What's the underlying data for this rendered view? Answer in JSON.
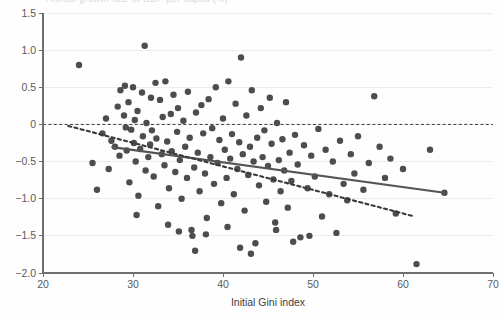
{
  "figure": {
    "background": "#fefefe",
    "point_color": "#4d4d4d",
    "solid_fit_color": "#555555",
    "dotted_fit_color": "#3a3a3a",
    "gridline_color": "#ededed",
    "axis_color": "#6f6f6f",
    "cropped_top_text": "Annual growth rate of GDP per capita (%)"
  },
  "chart_data": {
    "type": "scatter",
    "title": "",
    "xlabel": "Initial Gini index",
    "ylabel": "",
    "xlim": [
      20,
      70
    ],
    "ylim": [
      -2.0,
      1.5
    ],
    "xticks": [
      20,
      30,
      40,
      50,
      60,
      70
    ],
    "xtick_labels": [
      "20",
      "30",
      "40",
      "50",
      "60",
      "70"
    ],
    "yticks": [
      1.5,
      1.0,
      0.5,
      0,
      -0.5,
      -1.0,
      -1.5,
      -2.0
    ],
    "ytick_labels": [
      "1.5",
      "1.0",
      "0.5",
      "0",
      "−0.5",
      "−1.0",
      "−1.5",
      "−2.0"
    ],
    "grid": true,
    "legend": "none",
    "marker": "filled-circle",
    "marker_size_px": 6.4,
    "reference_lines": [
      {
        "name": "zero-reference-line",
        "style": "dashed",
        "y": 0,
        "x_from": 20,
        "x_to": 70
      }
    ],
    "fit_lines": [
      {
        "name": "solid-regression-line",
        "style": "solid",
        "x_from": 27.7,
        "y_from": -0.305,
        "x_to": 64.6,
        "y_to": -0.92
      },
      {
        "name": "dotted-regression-line",
        "style": "dotted",
        "x_from": 22.8,
        "y_from": -0.02,
        "x_to": 61.0,
        "y_to": -1.23
      }
    ],
    "points": [
      [
        24.0,
        0.8
      ],
      [
        26.6,
        -0.12
      ],
      [
        27.3,
        -0.6
      ],
      [
        27.6,
        -0.22
      ],
      [
        28.0,
        -0.3
      ],
      [
        28.3,
        0.24
      ],
      [
        28.5,
        -0.42
      ],
      [
        28.6,
        0.46
      ],
      [
        29.0,
        0.12
      ],
      [
        29.1,
        0.52
      ],
      [
        29.2,
        -0.04
      ],
      [
        29.3,
        -0.35
      ],
      [
        29.5,
        0.3
      ],
      [
        29.6,
        -0.78
      ],
      [
        29.8,
        -0.07
      ],
      [
        30.0,
        0.5
      ],
      [
        30.1,
        -0.25
      ],
      [
        30.2,
        0.06
      ],
      [
        30.3,
        -0.5
      ],
      [
        30.5,
        0.18
      ],
      [
        30.6,
        -0.96
      ],
      [
        30.8,
        -0.33
      ],
      [
        31.0,
        0.43
      ],
      [
        31.1,
        -0.16
      ],
      [
        31.3,
        1.06
      ],
      [
        31.4,
        -0.62
      ],
      [
        31.5,
        0.02
      ],
      [
        31.7,
        -0.44
      ],
      [
        31.9,
        -0.27
      ],
      [
        32.0,
        0.36
      ],
      [
        32.1,
        -0.08
      ],
      [
        32.3,
        -0.7
      ],
      [
        32.5,
        0.56
      ],
      [
        32.6,
        -0.19
      ],
      [
        32.8,
        -1.1
      ],
      [
        33.0,
        0.33
      ],
      [
        33.2,
        -0.4
      ],
      [
        33.3,
        0.1
      ],
      [
        33.5,
        -0.55
      ],
      [
        33.6,
        0.58
      ],
      [
        33.8,
        -0.23
      ],
      [
        34.0,
        -0.86
      ],
      [
        34.2,
        0.14
      ],
      [
        34.3,
        -0.36
      ],
      [
        34.5,
        0.4
      ],
      [
        34.7,
        -0.64
      ],
      [
        34.9,
        -0.1
      ],
      [
        35.0,
        0.22
      ],
      [
        35.2,
        -0.48
      ],
      [
        35.4,
        -1.0
      ],
      [
        35.6,
        0.05
      ],
      [
        35.8,
        -0.3
      ],
      [
        36.0,
        -0.72
      ],
      [
        36.1,
        0.44
      ],
      [
        36.3,
        -0.18
      ],
      [
        36.5,
        -1.42
      ],
      [
        36.6,
        -1.5
      ],
      [
        36.8,
        -0.58
      ],
      [
        37.0,
        0.16
      ],
      [
        37.2,
        -0.38
      ],
      [
        37.4,
        -0.9
      ],
      [
        37.6,
        0.26
      ],
      [
        37.8,
        -0.12
      ],
      [
        38.0,
        -0.66
      ],
      [
        38.2,
        -1.26
      ],
      [
        38.4,
        0.34
      ],
      [
        38.6,
        -0.44
      ],
      [
        38.8,
        -0.05
      ],
      [
        39.0,
        -0.8
      ],
      [
        39.2,
        0.5
      ],
      [
        39.4,
        -0.52
      ],
      [
        39.6,
        -0.21
      ],
      [
        39.8,
        -1.06
      ],
      [
        40.0,
        0.08
      ],
      [
        40.2,
        -0.34
      ],
      [
        40.4,
        -0.72
      ],
      [
        40.6,
        0.58
      ],
      [
        40.8,
        -0.46
      ],
      [
        41.0,
        -0.13
      ],
      [
        41.2,
        -0.94
      ],
      [
        41.4,
        0.28
      ],
      [
        41.6,
        -0.6
      ],
      [
        41.8,
        -0.24
      ],
      [
        42.0,
        0.9
      ],
      [
        42.2,
        -0.4
      ],
      [
        42.4,
        -1.16
      ],
      [
        42.6,
        0.12
      ],
      [
        42.8,
        -0.68
      ],
      [
        43.0,
        -0.3
      ],
      [
        43.2,
        0.46
      ],
      [
        43.4,
        -0.5
      ],
      [
        43.6,
        -1.6
      ],
      [
        43.8,
        -0.18
      ],
      [
        44.0,
        -0.82
      ],
      [
        44.2,
        0.22
      ],
      [
        44.4,
        -0.44
      ],
      [
        44.6,
        -0.08
      ],
      [
        44.8,
        -1.04
      ],
      [
        45.0,
        -0.56
      ],
      [
        45.2,
        0.36
      ],
      [
        45.4,
        -0.26
      ],
      [
        45.6,
        -0.74
      ],
      [
        45.8,
        -1.32
      ],
      [
        46.0,
        0.02
      ],
      [
        46.2,
        -0.48
      ],
      [
        46.4,
        -0.9
      ],
      [
        46.6,
        -0.2
      ],
      [
        46.8,
        -0.62
      ],
      [
        47.0,
        0.3
      ],
      [
        47.2,
        -1.12
      ],
      [
        47.4,
        -0.38
      ],
      [
        47.6,
        -0.76
      ],
      [
        48.0,
        -0.14
      ],
      [
        48.3,
        -0.54
      ],
      [
        48.6,
        -1.52
      ],
      [
        49.0,
        -0.28
      ],
      [
        49.4,
        -0.86
      ],
      [
        49.8,
        -0.42
      ],
      [
        50.2,
        -0.7
      ],
      [
        50.6,
        -0.06
      ],
      [
        51.0,
        -1.24
      ],
      [
        51.4,
        -0.34
      ],
      [
        51.8,
        -0.94
      ],
      [
        52.2,
        -0.5
      ],
      [
        52.6,
        -1.46
      ],
      [
        53.0,
        -0.22
      ],
      [
        53.4,
        -0.8
      ],
      [
        53.8,
        -1.02
      ],
      [
        54.2,
        -0.4
      ],
      [
        54.6,
        -0.66
      ],
      [
        55.0,
        -0.16
      ],
      [
        55.6,
        -0.88
      ],
      [
        56.2,
        -0.52
      ],
      [
        56.8,
        0.38
      ],
      [
        57.4,
        -0.3
      ],
      [
        58.0,
        -0.72
      ],
      [
        58.6,
        -0.46
      ],
      [
        59.2,
        -1.2
      ],
      [
        60.0,
        -0.6
      ],
      [
        61.5,
        -1.88
      ],
      [
        63.0,
        -0.34
      ],
      [
        64.6,
        -0.92
      ],
      [
        25.5,
        -0.52
      ],
      [
        26.0,
        -0.88
      ],
      [
        27.0,
        0.08
      ],
      [
        30.4,
        -1.22
      ],
      [
        33.9,
        -1.35
      ],
      [
        35.1,
        -1.44
      ],
      [
        36.9,
        -1.7
      ],
      [
        40.5,
        -1.38
      ],
      [
        41.9,
        -1.66
      ],
      [
        43.1,
        -1.74
      ],
      [
        38.1,
        -1.48
      ],
      [
        45.9,
        -1.42
      ],
      [
        47.8,
        -1.58
      ],
      [
        49.6,
        -1.5
      ]
    ]
  }
}
